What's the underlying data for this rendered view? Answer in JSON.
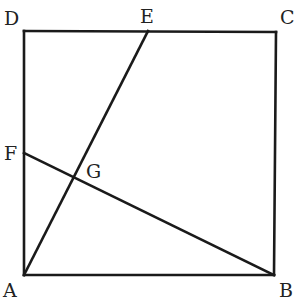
{
  "diagram": {
    "type": "geometry",
    "colors": {
      "line": "#1a1a1a",
      "label": "#222222",
      "background": "#ffffff"
    },
    "points": {
      "A": {
        "label": "A",
        "x": 24,
        "y": 275,
        "label_x": 3,
        "label_y": 297
      },
      "B": {
        "label": "B",
        "x": 274,
        "y": 275,
        "label_x": 279,
        "label_y": 297
      },
      "C": {
        "label": "C",
        "x": 276,
        "y": 32,
        "label_x": 280,
        "label_y": 24
      },
      "D": {
        "label": "D",
        "x": 24,
        "y": 31,
        "label_x": 4,
        "label_y": 25
      },
      "E": {
        "label": "E",
        "x": 148,
        "y": 31,
        "label_x": 140,
        "label_y": 23
      },
      "F": {
        "label": "F",
        "x": 24,
        "y": 153,
        "label_x": 4,
        "label_y": 160
      },
      "G": {
        "label": "G",
        "x": 75,
        "y": 178,
        "label_x": 86,
        "label_y": 178
      }
    },
    "segments": [
      {
        "from": "A",
        "to": "B"
      },
      {
        "from": "B",
        "to": "C"
      },
      {
        "from": "C",
        "to": "D"
      },
      {
        "from": "D",
        "to": "A"
      },
      {
        "from": "A",
        "to": "E"
      },
      {
        "from": "B",
        "to": "F"
      }
    ]
  }
}
